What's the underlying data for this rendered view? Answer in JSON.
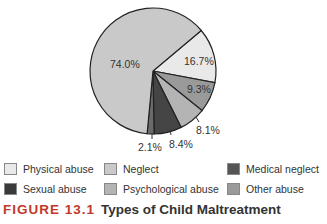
{
  "chart_data": {
    "type": "pie",
    "title": "Types of Child Maltreatment",
    "figure_label": "FIGURE 13.1",
    "slices": [
      {
        "name": "Physical abuse",
        "value": 16.7,
        "label": "16.7%",
        "color": "#e9e9e9"
      },
      {
        "name": "Other abuse",
        "value": 9.3,
        "label": "9.3%",
        "color": "#9a9a9a"
      },
      {
        "name": "Psychological abuse",
        "value": 8.1,
        "label": "8.1%",
        "color": "#b4b4b4"
      },
      {
        "name": "Sexual abuse",
        "value": 8.4,
        "label": "8.4%",
        "color": "#454545"
      },
      {
        "name": "Medical neglect",
        "value": 2.1,
        "label": "2.1%",
        "color": "#6a6a6a"
      },
      {
        "name": "Neglect",
        "value": 74.0,
        "label": "74.0%",
        "color": "#c9c9c9"
      }
    ],
    "legend": [
      "Physical abuse",
      "Neglect",
      "Medical neglect",
      "Sexual abuse",
      "Psychological abuse",
      "Other abuse"
    ],
    "legend_position": "bottom"
  },
  "labels": {
    "neglect": "74.0%",
    "physical": "16.7%",
    "other": "9.3%",
    "psych": "8.1%",
    "sexual": "8.4%",
    "medical": "2.1%"
  },
  "legend": {
    "physical": "Physical abuse",
    "neglect": "Neglect",
    "medical": "Medical neglect",
    "sexual": "Sexual abuse",
    "psych": "Psychological abuse",
    "other": "Other abuse"
  },
  "caption": {
    "figure": "FIGURE 13.1",
    "title": "Types of Child Maltreatment"
  }
}
